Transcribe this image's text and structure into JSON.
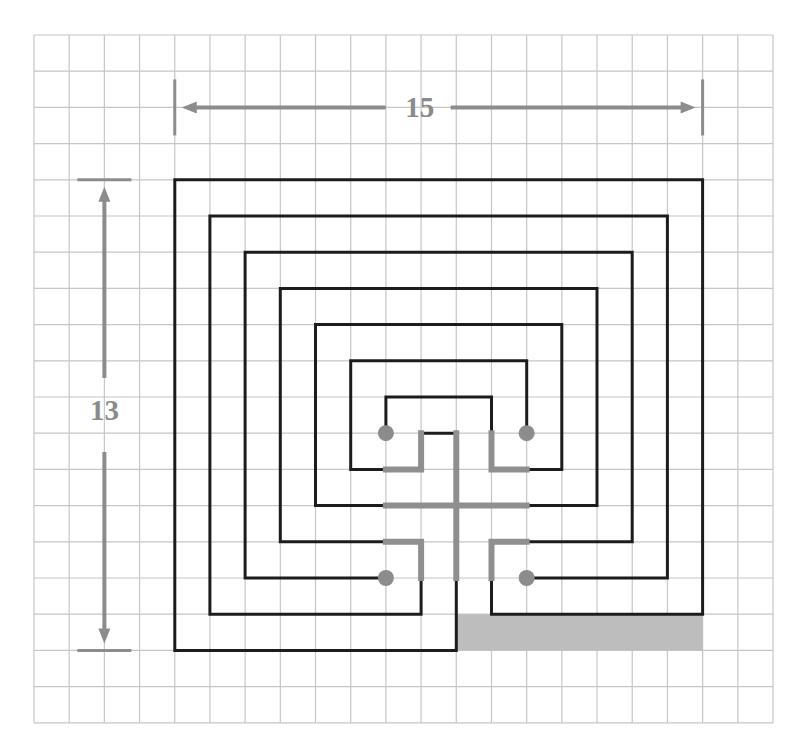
{
  "diagram": {
    "grid": {
      "origin_px": [
        34,
        35
      ],
      "cell_px": [
        35.19,
        36.2
      ],
      "columns": 21,
      "rows": 19,
      "line_color": "#c6c6c6"
    },
    "colors": {
      "wall": "#1c1c1c",
      "seed": "#8f8f8f",
      "dot": "#8c8c8c",
      "shade": "#bdbdbd",
      "dimension": "#8c8c8c"
    },
    "dimensions": {
      "width": {
        "label": "15",
        "from_col": 4,
        "to_col": 19,
        "row": 2
      },
      "height": {
        "label": "13",
        "from_row": 4,
        "to_row": 17,
        "col": 2
      }
    },
    "shaded_region": {
      "col0": 12,
      "row0": 16,
      "col1": 19,
      "row1": 17
    },
    "walls": [
      [
        [
          13,
          15
        ],
        [
          13,
          16
        ],
        [
          19,
          16
        ],
        [
          19,
          4
        ],
        [
          4,
          4
        ],
        [
          4,
          17
        ],
        [
          12,
          17
        ],
        [
          12,
          15
        ]
      ],
      [
        [
          11,
          15
        ],
        [
          11,
          16
        ],
        [
          5,
          16
        ],
        [
          5,
          5
        ],
        [
          18,
          5
        ],
        [
          18,
          15
        ],
        [
          14,
          15
        ]
      ],
      [
        [
          10,
          15
        ],
        [
          6,
          15
        ],
        [
          6,
          6
        ],
        [
          17,
          6
        ],
        [
          17,
          14
        ],
        [
          14,
          14
        ]
      ],
      [
        [
          10,
          14
        ],
        [
          7,
          14
        ],
        [
          7,
          7
        ],
        [
          16,
          7
        ],
        [
          16,
          13
        ],
        [
          14,
          13
        ]
      ],
      [
        [
          10,
          13
        ],
        [
          8,
          13
        ],
        [
          8,
          8
        ],
        [
          15,
          8
        ],
        [
          15,
          12
        ],
        [
          14,
          12
        ]
      ],
      [
        [
          10,
          12
        ],
        [
          9,
          12
        ],
        [
          9,
          9
        ],
        [
          14,
          9
        ],
        [
          14,
          11
        ]
      ],
      [
        [
          10,
          11
        ],
        [
          10,
          10
        ],
        [
          13,
          10
        ],
        [
          13,
          11
        ]
      ],
      [
        [
          11,
          11
        ],
        [
          12,
          11
        ]
      ]
    ],
    "seed_lines": [
      [
        [
          12,
          11
        ],
        [
          12,
          15
        ]
      ],
      [
        [
          10,
          13
        ],
        [
          14,
          13
        ]
      ],
      [
        [
          10,
          12
        ],
        [
          11,
          12
        ],
        [
          11,
          11
        ]
      ],
      [
        [
          13,
          11
        ],
        [
          13,
          12
        ],
        [
          14,
          12
        ]
      ],
      [
        [
          10,
          14
        ],
        [
          11,
          14
        ],
        [
          11,
          15
        ]
      ],
      [
        [
          14,
          14
        ],
        [
          13,
          14
        ],
        [
          13,
          15
        ]
      ]
    ],
    "dots": [
      [
        10,
        11
      ],
      [
        14,
        11
      ],
      [
        10,
        15
      ],
      [
        14,
        15
      ]
    ]
  }
}
